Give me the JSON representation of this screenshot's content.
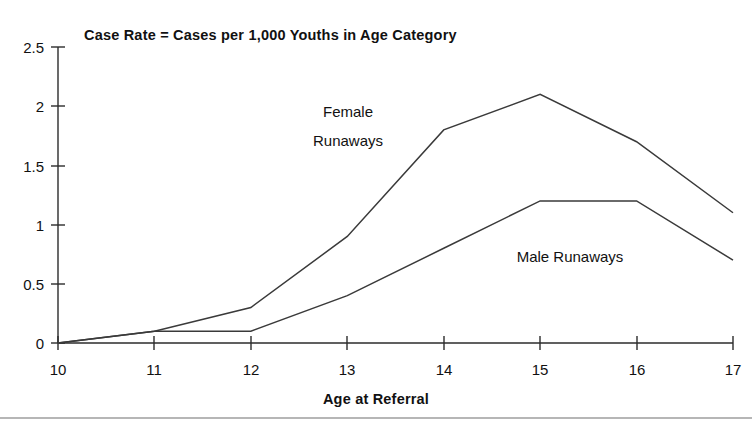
{
  "chart_data": {
    "type": "line",
    "title": "Case Rate = Cases per 1,000 Youths in Age Category",
    "xlabel": "Age at Referral",
    "ylabel": "",
    "x": [
      10,
      11,
      12,
      13,
      14,
      15,
      16,
      17
    ],
    "xticklabels": [
      "10",
      "11",
      "12",
      "13",
      "14",
      "15",
      "16",
      "17"
    ],
    "yticks": [
      0,
      0.5,
      1,
      1.5,
      2,
      2.5
    ],
    "yticklabels": [
      "0",
      "0.5",
      "1",
      "1.5",
      "2",
      "2.5"
    ],
    "xlim": [
      10,
      17
    ],
    "ylim": [
      0,
      2.5
    ],
    "grid": false,
    "legend_position": "inline-annotations",
    "series": [
      {
        "name": "Female Runaways",
        "values": [
          0,
          0.1,
          0.3,
          0.9,
          1.8,
          2.1,
          1.7,
          1.1
        ],
        "color": "#3a3a3a"
      },
      {
        "name": "Male Runaways",
        "values": [
          0,
          0.1,
          0.1,
          0.4,
          0.8,
          1.2,
          1.2,
          0.7
        ],
        "color": "#3a3a3a"
      }
    ],
    "annotations": [
      {
        "id": "female-annotation",
        "lines": [
          "Female",
          "Runaways"
        ],
        "x": 13.0,
        "y": 2.05
      },
      {
        "id": "male-annotation",
        "lines": [
          "Male Runaways"
        ],
        "x": 15.35,
        "y": 0.82
      }
    ]
  },
  "labels": {
    "title": "Case Rate = Cases per 1,000 Youths in Age Category",
    "x_axis_title": "Age at Referral",
    "y_0": "0",
    "y_1": "0.5",
    "y_2": "1",
    "y_3": "1.5",
    "y_4": "2",
    "y_5": "2.5",
    "x_0": "10",
    "x_1": "11",
    "x_2": "12",
    "x_3": "13",
    "x_4": "14",
    "x_5": "15",
    "x_6": "16",
    "x_7": "17",
    "female_line1": "Female",
    "female_line2": "Runaways",
    "male_line1": "Male Runaways"
  },
  "colors": {
    "line": "#3a3a3a",
    "axis": "#2b2b2b",
    "text": "#111111",
    "background": "#ffffff",
    "rule": "#6f6f6f"
  }
}
